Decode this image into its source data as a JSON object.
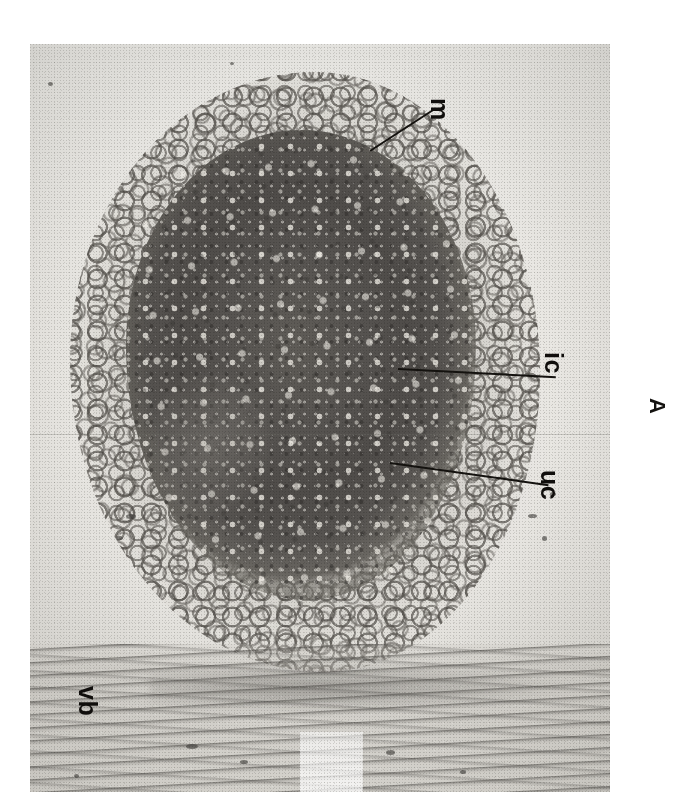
{
  "figure": {
    "panel_label": "A",
    "domain": "light-micrograph",
    "orientation_note": "image and all labels rotated 90 degrees clockwise",
    "plate": {
      "left": 30,
      "top": 44,
      "width": 580,
      "height": 748,
      "background_color": "#e9e7e3",
      "core_color": "#544f4b",
      "cortex_color": "#b9b6b0",
      "ink_color": "#14120f"
    }
  },
  "annotations": [
    {
      "id": "m",
      "label": "m",
      "meaning": "meristem",
      "label_x": 452,
      "label_y": 98,
      "leader": {
        "x": 370,
        "y": 150,
        "length": 78,
        "angle": -33
      }
    },
    {
      "id": "ic",
      "label": "ic",
      "meaning": "inner cortex",
      "label_x": 566,
      "label_y": 352,
      "leader": {
        "x": 398,
        "y": 368,
        "length": 158,
        "angle": 3
      }
    },
    {
      "id": "uc",
      "label": "uc",
      "meaning": "outer cortex",
      "label_x": 562,
      "label_y": 470,
      "leader": {
        "x": 390,
        "y": 462,
        "length": 160,
        "angle": 8
      }
    },
    {
      "id": "vb",
      "label": "vb",
      "meaning": "vascular bundle",
      "label_x": 100,
      "label_y": 686,
      "leader": null
    }
  ],
  "panel": {
    "letter": "A",
    "x": 668,
    "y": 398
  }
}
